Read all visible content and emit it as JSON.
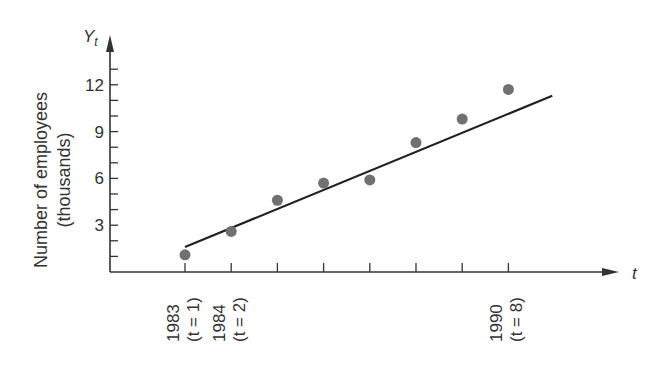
{
  "chart_data": {
    "type": "scatter",
    "title": "",
    "xlabel": "t",
    "ylabel": "Number of employees (thousands)",
    "ylabel_lines": [
      "Number of employees",
      "(thousands)"
    ],
    "y_axis_symbol": "Y",
    "y_axis_subscript": "t",
    "yticks": [
      3,
      6,
      9,
      12
    ],
    "ylim": [
      0,
      13.5
    ],
    "x": [
      1,
      2,
      3,
      4,
      5,
      6,
      7,
      8
    ],
    "values": [
      1.1,
      2.6,
      4.6,
      5.7,
      5.9,
      8.3,
      9.8,
      11.7
    ],
    "trend_line": {
      "x_start": 1,
      "y_start": 1.6,
      "x_end": 8.95,
      "y_end": 11.3
    },
    "x_tick_labels": [
      {
        "t": 1,
        "year": "1983",
        "index_label": "(t = 1)"
      },
      {
        "t": 2,
        "year": "1984",
        "index_label": "(t = 2)"
      },
      {
        "t": 8,
        "year": "1990",
        "index_label": "(t = 8)"
      }
    ],
    "grid": false,
    "legend": null
  },
  "colors": {
    "axis": "#333333",
    "point": "#707070",
    "line": "#222222"
  }
}
